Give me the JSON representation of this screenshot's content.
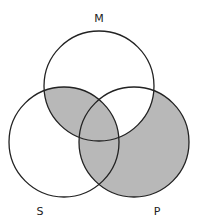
{
  "diagram": {
    "type": "venn",
    "shade_color": "#b8b8b8",
    "stroke_color": "#222222",
    "sets": [
      {
        "label": "M",
        "cx": 99,
        "cy": 86,
        "r": 55,
        "label_x": 99,
        "label_y": 18
      },
      {
        "label": "S",
        "cx": 64,
        "cy": 142,
        "r": 55,
        "label_x": 40,
        "label_y": 211
      },
      {
        "label": "P",
        "cx": 134,
        "cy": 142,
        "r": 55,
        "label_x": 157,
        "label_y": 211
      }
    ],
    "shaded_regions": [
      "S∩M only",
      "S∩M∩P",
      "S∩P only",
      "P only"
    ],
    "unshaded_regions": [
      "M only",
      "S only",
      "M∩P only"
    ]
  },
  "labels": {
    "m": "M",
    "s": "S",
    "p": "P"
  }
}
